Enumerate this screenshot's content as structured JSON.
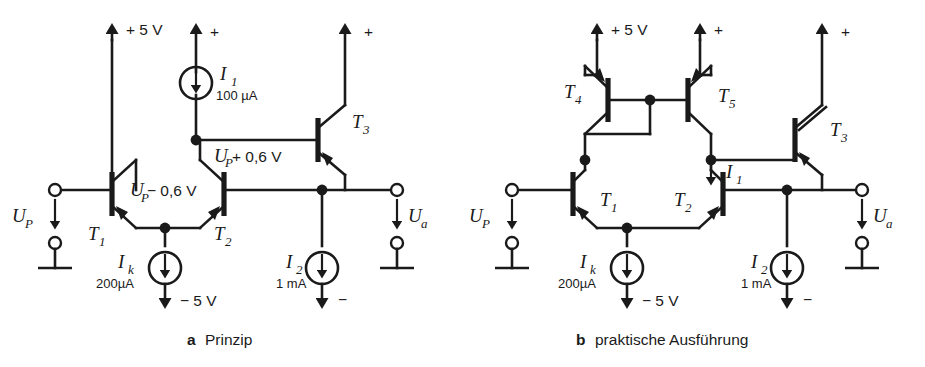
{
  "figure": {
    "kind": "circuit-diagram",
    "ink_color": "#1a1a1a",
    "background": "#ffffff"
  },
  "panel_a": {
    "caption_letter": "a",
    "caption_text": "Prinzip",
    "rail_positive": "+ 5 V",
    "rail_negative": "− 5 V",
    "plus_marker": "+",
    "minus_marker": "−",
    "input_label": "U",
    "input_sub": "P",
    "output_label": "U",
    "output_sub": "a",
    "transistors": [
      {
        "name": "T",
        "sub": "1",
        "type": "npn"
      },
      {
        "name": "T",
        "sub": "2",
        "type": "npn"
      },
      {
        "name": "T",
        "sub": "3",
        "type": "npn"
      }
    ],
    "sources": [
      {
        "name": "I",
        "sub": "1",
        "value": "100 µA",
        "direction": "down"
      },
      {
        "name": "I",
        "sub": "k",
        "value": "200µA",
        "direction": "down"
      },
      {
        "name": "I",
        "sub": "2",
        "value": "1 mA",
        "direction": "down"
      }
    ],
    "node_annotations": [
      {
        "text_1": "U",
        "sub": "P",
        "text_2": "+ 0,6 V"
      },
      {
        "text_1": "U",
        "sub": "P",
        "text_2": "− 0,6 V"
      }
    ]
  },
  "panel_b": {
    "caption_letter": "b",
    "caption_text": "praktische Ausführung",
    "rail_positive": "+ 5 V",
    "rail_negative": "− 5 V",
    "plus_marker": "+",
    "minus_marker": "−",
    "input_label": "U",
    "input_sub": "P",
    "output_label": "U",
    "output_sub": "a",
    "transistors": [
      {
        "name": "T",
        "sub": "1",
        "type": "npn"
      },
      {
        "name": "T",
        "sub": "2",
        "type": "npn"
      },
      {
        "name": "T",
        "sub": "3",
        "type": "npn"
      },
      {
        "name": "T",
        "sub": "4",
        "type": "pnp"
      },
      {
        "name": "T",
        "sub": "5",
        "type": "pnp"
      }
    ],
    "sources": [
      {
        "name": "I",
        "sub": "k",
        "value": "200µA",
        "direction": "down"
      },
      {
        "name": "I",
        "sub": "2",
        "value": "1 mA",
        "direction": "down"
      }
    ],
    "current_arrows": [
      {
        "name": "I",
        "sub": "1",
        "direction": "down"
      }
    ]
  }
}
